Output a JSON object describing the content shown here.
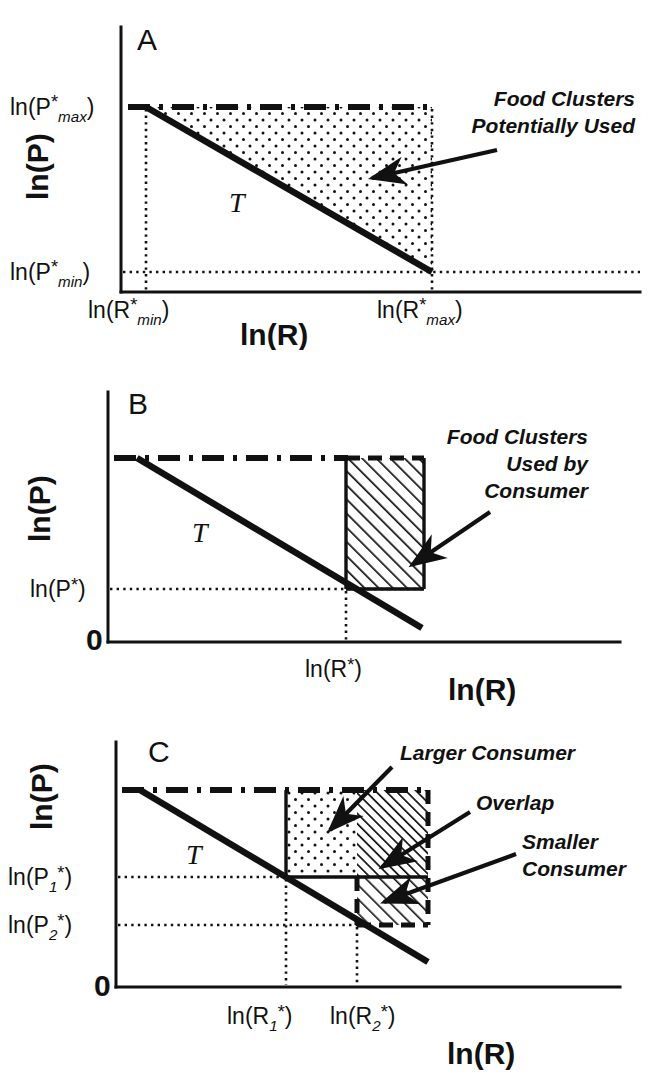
{
  "figure": {
    "caption_kind": "three-panel conceptual schematic",
    "background_color": "#ffffff",
    "ink_color": "#111111"
  },
  "chart_data": [
    {
      "type": "line",
      "panel": "A",
      "title": "",
      "xlabel": "ln(R)",
      "ylabel": "ln(P)",
      "xticklabels": [
        "ln(R*min)",
        "ln(R*max)"
      ],
      "yticklabels": [
        "ln(P*max)",
        "ln(P*min)"
      ],
      "grid": false,
      "legend": "none",
      "series": [
        {
          "name": "T",
          "style": "solid-thick",
          "x": [
            "ln(R*min)",
            "ln(R*max)"
          ],
          "y": [
            "ln(P*max)",
            "ln(P*min)"
          ]
        },
        {
          "name": "upper-bound",
          "style": "dash-dot",
          "x": [
            "ln(R*min)",
            "ln(R*max)"
          ],
          "y": [
            "ln(P*max)",
            "ln(P*max)"
          ]
        }
      ],
      "regions": [
        {
          "name": "Food Clusters Potentially Used",
          "fill": "stipple-dots",
          "bounds": {
            "left": "ln(R*min)",
            "right": "ln(R*max)",
            "top": "ln(P*max)",
            "bottom": "T-line"
          }
        }
      ],
      "annotations": [
        {
          "text": "Food Clusters",
          "line": 1
        },
        {
          "text": "Potentially Used",
          "line": 2
        }
      ],
      "curve_label": "T",
      "panel_label": "A"
    },
    {
      "type": "line",
      "panel": "B",
      "title": "",
      "xlabel": "ln(R)",
      "ylabel": "ln(P)",
      "xticklabels": [
        "ln(R*)"
      ],
      "yticklabels": [
        "ln(P*)",
        "0"
      ],
      "grid": false,
      "legend": "none",
      "series": [
        {
          "name": "T",
          "style": "solid-thick",
          "x": [
            "x-left",
            "x-right"
          ],
          "y": [
            "top",
            "below ln(P*)"
          ]
        },
        {
          "name": "upper-bound",
          "style": "dash-dot",
          "x": [
            "x-left",
            "ln(R*)"
          ],
          "y": [
            "top",
            "top"
          ]
        }
      ],
      "regions": [
        {
          "name": "Food Clusters Used by Consumer",
          "fill": "diagonal-hatch",
          "bounds": {
            "left": "ln(R*)",
            "right": "x-right",
            "top": "top",
            "bottom": "ln(P*)"
          }
        }
      ],
      "annotations": [
        {
          "text": "Food Clusters",
          "line": 1
        },
        {
          "text": "Used by",
          "line": 2
        },
        {
          "text": "Consumer",
          "line": 3
        }
      ],
      "curve_label": "T",
      "panel_label": "B"
    },
    {
      "type": "line",
      "panel": "C",
      "title": "",
      "xlabel": "ln(R)",
      "ylabel": "ln(P)",
      "xticklabels": [
        "ln(R1*)",
        "ln(R2*)"
      ],
      "yticklabels": [
        "ln(P1*)",
        "ln(P2*)",
        "0"
      ],
      "grid": false,
      "legend": "none",
      "series": [
        {
          "name": "T",
          "style": "solid-thick",
          "x": [
            "x-left",
            "x-right"
          ],
          "y": [
            "top",
            "below ln(P2*)"
          ]
        },
        {
          "name": "upper-bound",
          "style": "dash-dot",
          "x": [
            "x-left",
            "ln(R2*)"
          ],
          "y": [
            "top",
            "top"
          ]
        }
      ],
      "regions": [
        {
          "name": "Larger Consumer",
          "fill": "stipple-dots",
          "bounds": {
            "left": "ln(R1*)",
            "right": "ln(R2*)",
            "top": "top",
            "bottom": "ln(P1*)"
          }
        },
        {
          "name": "Overlap",
          "fill": "dense-diagonal-hatch",
          "bounds": {
            "left": "ln(R2*)",
            "right": "x-right",
            "top": "top",
            "bottom": "ln(P1*)"
          }
        },
        {
          "name": "Smaller Consumer",
          "fill": "diagonal-hatch",
          "bounds": {
            "left": "ln(R2*)",
            "right": "x-right",
            "top": "ln(P1*)",
            "bottom": "ln(P2*)"
          }
        }
      ],
      "annotations": [
        {
          "text": "Larger Consumer",
          "line": 1
        },
        {
          "text": "Overlap",
          "line": 2
        },
        {
          "text": "Smaller",
          "line": 3
        },
        {
          "text": "Consumer",
          "line": 4
        }
      ],
      "curve_label": "T",
      "panel_label": "C"
    }
  ],
  "panelA": {
    "label": "A",
    "ylabel": "ln(P)",
    "xlabel": "ln(R)",
    "curve_label": "T",
    "ytick_max": {
      "prefix": "ln(P",
      "star": "*",
      "sub": "max",
      "suffix": ")"
    },
    "ytick_min": {
      "prefix": "ln(P",
      "star": "*",
      "sub": "min",
      "suffix": ")"
    },
    "xtick_min": {
      "prefix": "ln(R",
      "star": "*",
      "sub": "min",
      "suffix": ")"
    },
    "xtick_max": {
      "prefix": "ln(R",
      "star": "*",
      "sub": "max",
      "suffix": ")"
    },
    "annotation_line1": "Food Clusters",
    "annotation_line2": "Potentially Used"
  },
  "panelB": {
    "label": "B",
    "ylabel": "ln(P)",
    "xlabel": "ln(R)",
    "curve_label": "T",
    "origin_label": "0",
    "ytick_pstar": {
      "prefix": "ln(P",
      "star": "*",
      "suffix": ")"
    },
    "xtick_rstar": {
      "prefix": "ln(R",
      "star": "*",
      "suffix": ")"
    },
    "annotation_line1": "Food Clusters",
    "annotation_line2": "Used by",
    "annotation_line3": "Consumer"
  },
  "panelC": {
    "label": "C",
    "ylabel": "ln(P)",
    "xlabel": "ln(R)",
    "curve_label": "T",
    "origin_label": "0",
    "ytick_p1": {
      "prefix": "ln(P",
      "sub": "1",
      "star": "*",
      "suffix": ")"
    },
    "ytick_p2": {
      "prefix": "ln(P",
      "sub": "2",
      "star": "*",
      "suffix": ")"
    },
    "xtick_r1": {
      "prefix": "ln(R",
      "sub": "1",
      "star": "*",
      "suffix": ")"
    },
    "xtick_r2": {
      "prefix": "ln(R",
      "sub": "2",
      "star": "*",
      "suffix": ")"
    },
    "annotation_larger": "Larger Consumer",
    "annotation_overlap": "Overlap",
    "annotation_smaller_line1": "Smaller",
    "annotation_smaller_line2": "Consumer"
  }
}
